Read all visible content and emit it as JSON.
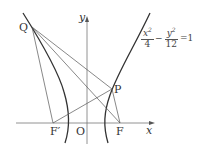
{
  "diagram": {
    "type": "hyperbola-geometry",
    "equation": {
      "term1_num": "x",
      "term1_exp": "2",
      "term1_den": "4",
      "minus": "−",
      "term2_num": "y",
      "term2_exp": "2",
      "term2_den": "12",
      "rhs": "=1"
    },
    "axes": {
      "x_label": "x",
      "y_label": "y",
      "origin_label": "O"
    },
    "points": {
      "Q": {
        "label": "Q",
        "px": [
          32,
          27
        ]
      },
      "P": {
        "label": "P",
        "px": [
          112,
          89
        ]
      },
      "F": {
        "label": "F",
        "px": [
          120,
          123
        ]
      },
      "F_prime": {
        "label": "F′",
        "px": [
          53,
          123
        ]
      }
    },
    "segments": [
      [
        "Q",
        "P"
      ],
      [
        "Q",
        "F"
      ],
      [
        "Q",
        "F_prime"
      ],
      [
        "F_prime",
        "P"
      ],
      [
        "P",
        "F"
      ]
    ],
    "colors": {
      "line": "#555555",
      "curve": "#333333",
      "axis": "#777777"
    }
  }
}
